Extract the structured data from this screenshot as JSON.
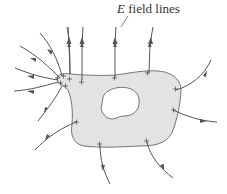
{
  "diagram": {
    "label": {
      "symbol": "E",
      "text": " field lines"
    },
    "colors": {
      "conductor_fill": "#e3e3e3",
      "outline": "#666666",
      "field_line": "#555555",
      "cavity_fill": "#ffffff",
      "charge": "#555555"
    },
    "charge_symbol": "+",
    "charges_count": 14,
    "field_lines_count": 14
  }
}
